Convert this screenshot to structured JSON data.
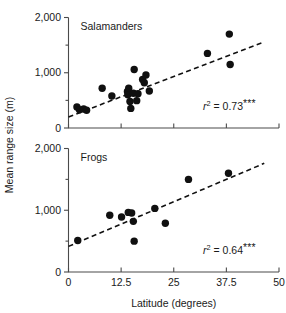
{
  "figure": {
    "axis_titles": {
      "y": "Mean range size (m)",
      "x": "Latitude (degrees)"
    },
    "x_ticks": [
      "0",
      "12.5",
      "25",
      "37.5",
      "50"
    ],
    "x_tick_values": [
      0,
      12.5,
      25,
      37.5,
      50
    ],
    "y_ticks": [
      "0",
      "1,000",
      "2,000"
    ],
    "y_tick_values": [
      0,
      1000,
      2000
    ],
    "y_minor_values": [
      500,
      1500
    ],
    "colors": {
      "point": "#101010",
      "axis": "#4a4a4a",
      "trend": "#111111",
      "text": "#1a1a1a",
      "background": "#ffffff"
    }
  },
  "chart_data": [
    {
      "type": "scatter",
      "title": "Salamanders",
      "panel": "top",
      "xlabel": "Latitude (degrees)",
      "ylabel": "Mean range size (m)",
      "xlim": [
        0,
        50
      ],
      "ylim": [
        0,
        2000
      ],
      "grid": false,
      "legend": "none",
      "annotation": {
        "symbol": "r",
        "exponent": "2",
        "equals": "=",
        "value": "0.73",
        "significance": "***",
        "full_text": "r2 = 0.73***"
      },
      "points": [
        {
          "x": 2.0,
          "y": 380
        },
        {
          "x": 2.6,
          "y": 330
        },
        {
          "x": 3.6,
          "y": 345
        },
        {
          "x": 4.3,
          "y": 320
        },
        {
          "x": 8.0,
          "y": 720
        },
        {
          "x": 10.3,
          "y": 580
        },
        {
          "x": 14.0,
          "y": 660
        },
        {
          "x": 14.1,
          "y": 600
        },
        {
          "x": 14.3,
          "y": 720
        },
        {
          "x": 14.6,
          "y": 480
        },
        {
          "x": 14.8,
          "y": 355
        },
        {
          "x": 15.4,
          "y": 630
        },
        {
          "x": 15.6,
          "y": 1060
        },
        {
          "x": 16.2,
          "y": 495
        },
        {
          "x": 16.5,
          "y": 620
        },
        {
          "x": 17.6,
          "y": 880
        },
        {
          "x": 18.0,
          "y": 820
        },
        {
          "x": 18.4,
          "y": 960
        },
        {
          "x": 19.2,
          "y": 670
        },
        {
          "x": 33.0,
          "y": 1350
        },
        {
          "x": 38.2,
          "y": 1700
        },
        {
          "x": 38.4,
          "y": 1150
        }
      ],
      "trendline": {
        "x0": 0.0,
        "y0": 200,
        "x1": 46.5,
        "y1": 1560
      }
    },
    {
      "type": "scatter",
      "title": "Frogs",
      "panel": "bottom",
      "xlabel": "Latitude (degrees)",
      "ylabel": "Mean range size (m)",
      "xlim": [
        0,
        50
      ],
      "ylim": [
        0,
        2000
      ],
      "grid": false,
      "legend": "none",
      "annotation": {
        "symbol": "r",
        "exponent": "2",
        "equals": "=",
        "value": "0.64",
        "significance": "***",
        "full_text": "r2 = 0.64***"
      },
      "points": [
        {
          "x": 2.2,
          "y": 510
        },
        {
          "x": 9.8,
          "y": 920
        },
        {
          "x": 12.6,
          "y": 890
        },
        {
          "x": 14.2,
          "y": 965
        },
        {
          "x": 15.0,
          "y": 955
        },
        {
          "x": 15.4,
          "y": 820
        },
        {
          "x": 15.6,
          "y": 500
        },
        {
          "x": 20.5,
          "y": 1030
        },
        {
          "x": 23.0,
          "y": 790
        },
        {
          "x": 28.5,
          "y": 1500
        },
        {
          "x": 38.0,
          "y": 1600
        }
      ],
      "trendline": {
        "x0": 0.0,
        "y0": 415,
        "x1": 46.5,
        "y1": 1760
      }
    }
  ]
}
